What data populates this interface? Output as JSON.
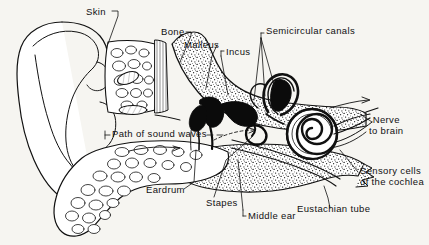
{
  "figure": {
    "background_color": "#f6f5f1",
    "ink_color": "#111111",
    "width": 429,
    "height": 245
  },
  "labels": [
    {
      "id": "skin",
      "text": "Skin",
      "x": 86,
      "y": 8,
      "leader": "line-down-right"
    },
    {
      "id": "bone",
      "text": "Bone",
      "x": 161,
      "y": 29,
      "leader": "line-down-right"
    },
    {
      "id": "malleus",
      "text": "Malleus",
      "x": 184,
      "y": 42,
      "leader": "line-down-right"
    },
    {
      "id": "incus",
      "text": "Incus",
      "x": 224,
      "y": 54,
      "leader": "bracket-down"
    },
    {
      "id": "semicircular-canals",
      "text": "Semicircular canals",
      "x": 264,
      "y": 29,
      "leader": "fan-down-left"
    },
    {
      "id": "nerve-to-brain",
      "text": "Nerve",
      "text2": "to brain",
      "x": 374,
      "y": 117,
      "leader": "arrow-left"
    },
    {
      "id": "sensory-cells",
      "text": "Sensory cells",
      "text2": "of the cochlea",
      "x": 362,
      "y": 167,
      "leader": "line-up-left"
    },
    {
      "id": "path-of-sound-waves",
      "text": "Path of sound waves",
      "x": 113,
      "y": 130,
      "leader": "dashes-both-sides"
    },
    {
      "id": "eardrum",
      "text": "Eardrum",
      "x": 147,
      "y": 187,
      "leader": "line-up-right"
    },
    {
      "id": "stapes",
      "text": "Stapes",
      "x": 207,
      "y": 200,
      "leader": "line-up"
    },
    {
      "id": "middle-ear",
      "text": "Middle ear",
      "x": 247,
      "y": 212,
      "leader": "bracket-up"
    },
    {
      "id": "eustachian-tube",
      "text": "Eustachian tube",
      "x": 298,
      "y": 205,
      "leader": "line-up"
    }
  ],
  "anatomy_parts": [
    "pinna-outer-ear",
    "ear-canal",
    "eardrum-tympanic-membrane",
    "malleus-hammer",
    "incus-anvil",
    "stapes-stirrup",
    "semicircular-canals",
    "cochlea-spiral",
    "auditory-nerve",
    "eustachian-tube",
    "temporal-bone",
    "cartilage-tissue"
  ]
}
